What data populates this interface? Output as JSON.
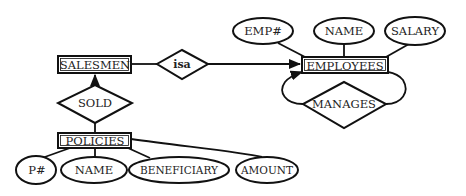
{
  "diagram": {
    "type": "entity-relationship",
    "entities": [
      {
        "id": "salesmen",
        "label": "SALESMEN"
      },
      {
        "id": "employees",
        "label": "EMPLOYEES"
      },
      {
        "id": "policies",
        "label": "POLICIES"
      }
    ],
    "relationships": [
      {
        "id": "isa",
        "label": "isa",
        "connects": [
          "salesmen",
          "employees"
        ]
      },
      {
        "id": "sold",
        "label": "SOLD",
        "connects": [
          "salesmen",
          "policies"
        ]
      },
      {
        "id": "manages",
        "label": "MANAGES",
        "connects": [
          "employees",
          "employees"
        ]
      }
    ],
    "attributes": {
      "employees": [
        {
          "id": "emp_no",
          "label": "EMP#"
        },
        {
          "id": "emp_name",
          "label": "NAME"
        },
        {
          "id": "salary",
          "label": "SALARY"
        }
      ],
      "policies": [
        {
          "id": "p_no",
          "label": "P#"
        },
        {
          "id": "policy_name",
          "label": "NAME"
        },
        {
          "id": "beneficiary",
          "label": "BENEFICIARY"
        },
        {
          "id": "amount",
          "label": "AMOUNT"
        }
      ]
    },
    "colors": {
      "stroke": "#111111",
      "text": "#222222",
      "background": "#ffffff"
    }
  }
}
